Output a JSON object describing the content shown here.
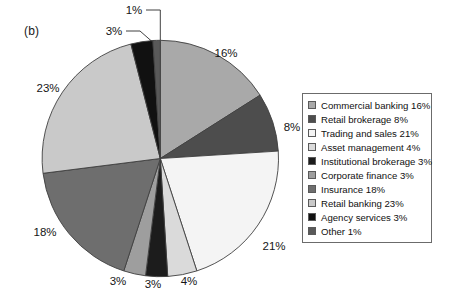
{
  "figure": {
    "panel_label": "(b)"
  },
  "legend": {
    "entries": [
      {
        "label": "Commercial banking 16%",
        "color": "#a9a9a9"
      },
      {
        "label": "Retail brokerage 8%",
        "color": "#4d4d4d"
      },
      {
        "label": "Trading and sales 21%",
        "color": "#f4f4f4"
      },
      {
        "label": "Asset management 4%",
        "color": "#dadada"
      },
      {
        "label": "Institutional brokerage 3%",
        "color": "#1c1c1c"
      },
      {
        "label": "Corporate finance 3%",
        "color": "#9e9e9e"
      },
      {
        "label": "Insurance 18%",
        "color": "#6e6e6e"
      },
      {
        "label": "Retail banking 23%",
        "color": "#c9c9c9"
      },
      {
        "label": "Agency services 3%",
        "color": "#111111"
      },
      {
        "label": "Other 1%",
        "color": "#595959"
      }
    ]
  },
  "callouts": {
    "pct_16": "16%",
    "pct_8": "8%",
    "pct_21": "21%",
    "pct_4": "4%",
    "pct_3_institutional": "3%",
    "pct_3_corporate": "3%",
    "pct_18": "18%",
    "pct_23": "23%",
    "pct_3_agency": "3%",
    "pct_1_other": "1%"
  },
  "chart_data": {
    "type": "pie",
    "title": "(b)",
    "xlabel": "",
    "ylabel": "",
    "legend_position": "right",
    "grid": false,
    "start_angle_deg": 0,
    "direction": "clockwise",
    "units": "percent",
    "total": 100,
    "categories": [
      "Commercial banking",
      "Retail brokerage",
      "Trading and sales",
      "Asset management",
      "Institutional brokerage",
      "Corporate finance",
      "Insurance",
      "Retail banking",
      "Agency services",
      "Other"
    ],
    "values": [
      16,
      8,
      21,
      4,
      3,
      3,
      18,
      23,
      3,
      1
    ],
    "colors": [
      "#a9a9a9",
      "#4d4d4d",
      "#f4f4f4",
      "#dadada",
      "#1c1c1c",
      "#9e9e9e",
      "#6e6e6e",
      "#c9c9c9",
      "#111111",
      "#595959"
    ],
    "data_labels": [
      "16%",
      "8%",
      "21%",
      "4%",
      "3%",
      "3%",
      "18%",
      "23%",
      "3%",
      "1%"
    ],
    "leader_lines": [
      "Agency services",
      "Other"
    ]
  }
}
